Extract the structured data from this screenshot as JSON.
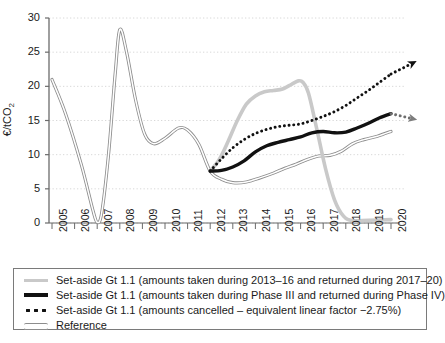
{
  "chart_data": {
    "type": "line",
    "title": "",
    "xlabel": "",
    "ylabel": "€/tCO",
    "ylabel_sub": "2",
    "ylim": [
      0,
      30
    ],
    "ytick_values": [
      30,
      25,
      20,
      15,
      10,
      5,
      0
    ],
    "grid": true,
    "grid_orientation": "horizontal",
    "legend_position": "below-plot",
    "x_categories": [
      "2005",
      "2006",
      "2007",
      "2008",
      "2009",
      "2010",
      "2011",
      "2012",
      "2013",
      "2014",
      "2015",
      "2016",
      "2017",
      "2018",
      "2019",
      "2020"
    ],
    "series": [
      {
        "name": "Set-aside Gt 1.1 (amounts taken during 2013–16 and returned during 2017–20)",
        "style": "thick-light-grey",
        "color": "#c9c9c9",
        "x": [
          2012,
          2012.4,
          2012.8,
          2013.2,
          2013.6,
          2014,
          2014.4,
          2014.8,
          2015.2,
          2015.6,
          2015.9,
          2016.1,
          2016.35,
          2016.7,
          2017.1,
          2017.5,
          2017.9,
          2018.3,
          2019,
          2020
        ],
        "values": [
          7.6,
          9.3,
          12.0,
          15.0,
          17.4,
          18.6,
          19.2,
          19.4,
          19.6,
          20.3,
          20.8,
          20.6,
          19.0,
          14.0,
          8.0,
          3.4,
          1.0,
          0.35,
          0.4,
          0.5
        ]
      },
      {
        "name": "Set-aside Gt 1.1 (amounts taken during Phase III and returned during Phase IV)",
        "style": "thick-black",
        "color": "#111111",
        "x": [
          2012,
          2012.5,
          2013,
          2013.5,
          2014,
          2014.5,
          2015,
          2015.5,
          2016,
          2016.5,
          2017,
          2017.5,
          2018,
          2018.5,
          2019,
          2019.5,
          2020
        ],
        "values": [
          7.6,
          7.7,
          8.2,
          9.1,
          10.4,
          11.3,
          11.8,
          12.2,
          12.6,
          13.2,
          13.4,
          13.2,
          13.3,
          13.9,
          14.6,
          15.4,
          16.0
        ],
        "arrow_end": {
          "x": 2020.9,
          "y": 15.3,
          "direction": "down-right",
          "color": "#6e6e6e"
        }
      },
      {
        "name": "Set-aside Gt 1.1 (amounts cancelled – equivalent linear factor −2.75%)",
        "style": "dotted-black",
        "color": "#111111",
        "x": [
          2012,
          2012.5,
          2013,
          2013.5,
          2014,
          2014.5,
          2015,
          2015.5,
          2016,
          2016.5,
          2017,
          2017.5,
          2018,
          2018.5,
          2019,
          2019.5,
          2020
        ],
        "values": [
          7.6,
          9.4,
          11.0,
          12.2,
          13.1,
          13.7,
          14.1,
          14.3,
          14.5,
          15.0,
          15.6,
          16.3,
          17.2,
          18.3,
          19.4,
          20.6,
          21.8
        ],
        "arrow_end": {
          "x": 2020.9,
          "y": 23.3,
          "direction": "up-right",
          "color": "#111111"
        }
      },
      {
        "name": "Reference",
        "style": "thin-double-line",
        "color": "#8d8d8d",
        "x": [
          2005,
          2005.6,
          2006.3,
          2006.8,
          2007.0,
          2007.2,
          2007.5,
          2007.8,
          2008.0,
          2008.3,
          2008.7,
          2009.1,
          2009.5,
          2010.0,
          2010.6,
          2011.0,
          2011.5,
          2012.0,
          2012.5,
          2013.0,
          2013.6,
          2014.2,
          2014.8,
          2015.3,
          2015.8,
          2016.3,
          2016.8,
          2017.3,
          2017.8,
          2018.3,
          2018.8,
          2019.4,
          2020.0
        ],
        "values": [
          21.0,
          16.0,
          8.5,
          2.0,
          0.1,
          1.5,
          10.0,
          22.0,
          28.3,
          25.0,
          18.0,
          13.0,
          11.6,
          12.4,
          13.9,
          13.6,
          11.5,
          7.6,
          6.4,
          5.9,
          6.0,
          6.6,
          7.3,
          8.0,
          8.6,
          9.3,
          9.8,
          9.9,
          10.5,
          11.6,
          12.2,
          12.7,
          13.4
        ]
      }
    ]
  },
  "legend": {
    "items": [
      {
        "marker": "thick-light-grey-line",
        "label": "Set-aside Gt 1.1 (amounts taken during 2013–16 and returned during 2017–20)"
      },
      {
        "marker": "thick-black-line",
        "label": "Set-aside Gt 1.1 (amounts taken during Phase III and returned during Phase IV)"
      },
      {
        "marker": "black-dots",
        "label": "Set-aside Gt 1.1 (amounts cancelled – equivalent linear factor −2.75%)"
      },
      {
        "marker": "thin-double-line",
        "label": "Reference"
      }
    ]
  }
}
